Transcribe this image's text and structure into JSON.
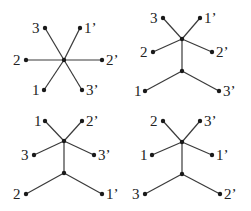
{
  "colors": {
    "edge": "#3a3a3a",
    "node": "#1a1a1a",
    "text": "#222222",
    "background": "#ffffff"
  },
  "panels": [
    {
      "id": "star",
      "internal_nodes": [
        {
          "x": 64,
          "y": 60
        }
      ],
      "leaves": [
        {
          "label": "3",
          "x": 45,
          "y": 28,
          "lx": 32,
          "ly": 33,
          "parent": 0
        },
        {
          "label": "1’",
          "x": 80,
          "y": 28,
          "lx": 84,
          "ly": 33,
          "parent": 0
        },
        {
          "label": "2",
          "x": 26,
          "y": 60,
          "lx": 13,
          "ly": 65,
          "parent": 0
        },
        {
          "label": "2’",
          "x": 102,
          "y": 60,
          "lx": 106,
          "ly": 65,
          "parent": 0
        },
        {
          "label": "1",
          "x": 44,
          "y": 90,
          "lx": 32,
          "ly": 95,
          "parent": 0
        },
        {
          "label": "3’",
          "x": 82,
          "y": 90,
          "lx": 86,
          "ly": 95,
          "parent": 0
        }
      ],
      "internal_edges": []
    },
    {
      "id": "tree-a",
      "internal_nodes": [
        {
          "x": 182,
          "y": 39
        },
        {
          "x": 182,
          "y": 71
        }
      ],
      "leaves": [
        {
          "label": "3",
          "x": 163,
          "y": 18,
          "lx": 150,
          "ly": 23,
          "parent": 0
        },
        {
          "label": "1’",
          "x": 200,
          "y": 18,
          "lx": 204,
          "ly": 23,
          "parent": 0
        },
        {
          "label": "2",
          "x": 153,
          "y": 52,
          "lx": 140,
          "ly": 57,
          "parent": 0
        },
        {
          "label": "2’",
          "x": 212,
          "y": 52,
          "lx": 216,
          "ly": 57,
          "parent": 0
        },
        {
          "label": "1",
          "x": 145,
          "y": 91,
          "lx": 134,
          "ly": 96,
          "parent": 1
        },
        {
          "label": "3’",
          "x": 219,
          "y": 91,
          "lx": 223,
          "ly": 96,
          "parent": 1
        }
      ],
      "internal_edges": [
        [
          0,
          1
        ]
      ]
    },
    {
      "id": "tree-b",
      "internal_nodes": [
        {
          "x": 64,
          "y": 141
        },
        {
          "x": 64,
          "y": 173
        }
      ],
      "leaves": [
        {
          "label": "1",
          "x": 45,
          "y": 121,
          "lx": 34,
          "ly": 126,
          "parent": 0
        },
        {
          "label": "2’",
          "x": 82,
          "y": 121,
          "lx": 86,
          "ly": 126,
          "parent": 0
        },
        {
          "label": "3",
          "x": 34,
          "y": 155,
          "lx": 21,
          "ly": 160,
          "parent": 0
        },
        {
          "label": "3’",
          "x": 94,
          "y": 155,
          "lx": 98,
          "ly": 160,
          "parent": 0
        },
        {
          "label": "2",
          "x": 26,
          "y": 194,
          "lx": 13,
          "ly": 199,
          "parent": 1
        },
        {
          "label": "1’",
          "x": 102,
          "y": 194,
          "lx": 106,
          "ly": 199,
          "parent": 1
        }
      ],
      "internal_edges": [
        [
          0,
          1
        ]
      ]
    },
    {
      "id": "tree-c",
      "internal_nodes": [
        {
          "x": 182,
          "y": 142
        },
        {
          "x": 182,
          "y": 174
        }
      ],
      "leaves": [
        {
          "label": "2",
          "x": 163,
          "y": 121,
          "lx": 150,
          "ly": 126,
          "parent": 0
        },
        {
          "label": "3’",
          "x": 200,
          "y": 121,
          "lx": 204,
          "ly": 126,
          "parent": 0
        },
        {
          "label": "1",
          "x": 152,
          "y": 155,
          "lx": 140,
          "ly": 160,
          "parent": 0
        },
        {
          "label": "1’",
          "x": 212,
          "y": 155,
          "lx": 216,
          "ly": 160,
          "parent": 0
        },
        {
          "label": "3",
          "x": 145,
          "y": 194,
          "lx": 132,
          "ly": 199,
          "parent": 1
        },
        {
          "label": "2’",
          "x": 220,
          "y": 194,
          "lx": 224,
          "ly": 199,
          "parent": 1
        }
      ],
      "internal_edges": [
        [
          0,
          1
        ]
      ]
    }
  ]
}
